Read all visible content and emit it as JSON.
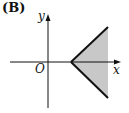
{
  "figure": {
    "option_label": "(B)",
    "axis_labels": {
      "x": "x",
      "y": "y",
      "origin": "O"
    },
    "colors": {
      "shade": "#c8c8c8",
      "stroke": "#111111"
    },
    "region": {
      "description": "Shaded wedge opening to the right with vertex on positive x-axis",
      "vertex": [
        71,
        62
      ],
      "upper_ray_end": [
        108,
        27
      ],
      "lower_ray_end": [
        108,
        98
      ]
    }
  }
}
